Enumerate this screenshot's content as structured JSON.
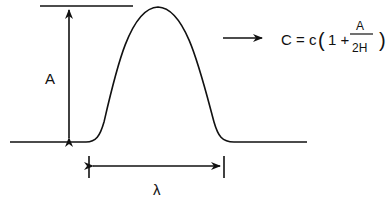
{
  "diagram": {
    "amplitude_label": "A",
    "wavelength_label": "λ",
    "formula": {
      "lhs": "C = c",
      "open_paren": "(",
      "one_plus": "1 +",
      "numerator": "A",
      "denominator": "2H",
      "close_paren": ")"
    },
    "colors": {
      "stroke": "#111111",
      "background": "#ffffff"
    }
  }
}
